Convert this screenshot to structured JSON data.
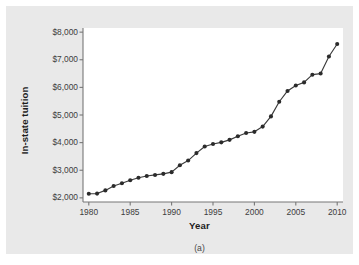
{
  "chart_data": {
    "type": "line",
    "title": "",
    "caption": "(a)",
    "xlabel": "Year",
    "ylabel": "In-state tuition",
    "xlim": [
      1979.3,
      2010.7
    ],
    "ylim": [
      1850,
      8150
    ],
    "grid": false,
    "legend": false,
    "marker": "filled-circle",
    "x_ticks": [
      1980,
      1985,
      1990,
      1995,
      2000,
      2005,
      2010
    ],
    "x_tick_labels": [
      "1980",
      "1985",
      "1990",
      "1995",
      "2000",
      "2005",
      "2010"
    ],
    "y_ticks": [
      2000,
      3000,
      4000,
      5000,
      6000,
      7000,
      8000
    ],
    "y_tick_labels": [
      "$2,000",
      "$3,000",
      "$4,000",
      "$5,000",
      "$6,000",
      "$7,000",
      "$8,000"
    ],
    "series": [
      {
        "name": "In-state tuition",
        "color": "#2b2b2b",
        "x": [
          1980,
          1981,
          1982,
          1983,
          1984,
          1985,
          1986,
          1987,
          1988,
          1989,
          1990,
          1991,
          1992,
          1993,
          1994,
          1995,
          1996,
          1997,
          1998,
          1999,
          2000,
          2001,
          2002,
          2003,
          2004,
          2005,
          2006,
          2007,
          2008,
          2009,
          2010
        ],
        "values": [
          2150,
          2155,
          2270,
          2430,
          2530,
          2640,
          2730,
          2790,
          2830,
          2870,
          2930,
          3180,
          3350,
          3620,
          3860,
          3950,
          4010,
          4100,
          4230,
          4350,
          4390,
          4580,
          4950,
          5480,
          5870,
          6070,
          6180,
          6460,
          6500,
          7120,
          7570
        ]
      }
    ]
  },
  "figure": {
    "panel_background": "#e9e9e9",
    "plot_background": "#ffffff",
    "axis_color": "#777777"
  }
}
